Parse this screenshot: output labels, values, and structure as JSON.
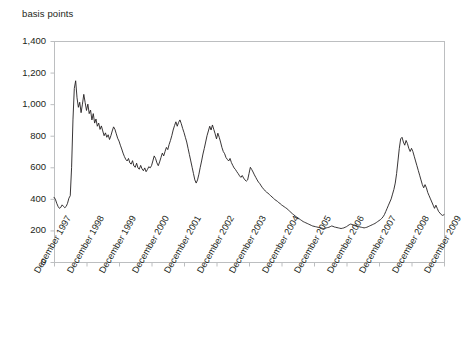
{
  "chart_data": {
    "type": "line",
    "title": "",
    "xlabel": "",
    "ylabel": "basis points",
    "ylim": [
      0,
      1400
    ],
    "yticks": [
      0,
      200,
      400,
      600,
      800,
      1000,
      1200,
      1400
    ],
    "ytick_labels": [
      "0",
      "200",
      "400",
      "600",
      "800",
      "1,000",
      "1,200",
      "1,400"
    ],
    "xtick_labels": [
      "December 1997",
      "December 1998",
      "December 1999",
      "December 2000",
      "December 2001",
      "December 2002",
      "December 2003",
      "December 2004",
      "December 2005",
      "December 2006",
      "December 2007",
      "December 2008",
      "December 2009"
    ],
    "grid": false,
    "legend": null,
    "line_color": "#231f20",
    "axis_color": "#bcbec0",
    "series": [
      {
        "name": "spread",
        "x_start": "December 1997",
        "x_end": "December 2009",
        "x_step_years": 0.0833,
        "values": [
          410,
          398,
          372,
          352,
          340,
          346,
          362,
          352,
          344,
          352,
          372,
          404,
          420,
          600,
          900,
          1100,
          1148,
          1040,
          980,
          1012,
          946,
          1000,
          1062,
          1010,
          960,
          1000,
          940,
          962,
          900,
          940,
          880,
          906,
          860,
          880,
          840,
          862,
          830,
          800,
          818,
          790,
          806,
          776,
          800,
          830,
          856,
          840,
          812,
          784,
          766,
          740,
          716,
          690,
          668,
          650,
          640,
          656,
          628,
          620,
          642,
          608,
          600,
          626,
          596,
          588,
          612,
          590,
          578,
          596,
          572,
          586,
          604,
          596,
          610,
          640,
          672,
          656,
          628,
          610,
          634,
          662,
          690,
          672,
          700,
          726,
          712,
          744,
          770,
          800,
          836,
          864,
          888,
          860,
          884,
          900,
          876,
          846,
          820,
          790,
          760,
          720,
          680,
          640,
          600,
          560,
          520,
          500,
          520,
          556,
          600,
          640,
          684,
          720,
          760,
          800,
          830,
          860,
          836,
          868,
          840,
          812,
          780,
          816,
          790,
          760,
          726,
          700,
          686,
          662,
          650,
          640,
          656,
          630,
          612,
          596,
          586,
          572,
          560,
          546,
          536,
          548,
          532,
          520,
          512,
          520,
          560,
          600,
          586,
          570,
          552,
          536,
          520,
          506,
          496,
          482,
          470,
          460,
          450,
          442,
          436,
          428,
          420,
          412,
          404,
          396,
          390,
          384,
          376,
          370,
          362,
          356,
          350,
          344,
          338,
          330,
          322,
          314,
          306,
          300,
          292,
          286,
          280,
          274,
          268,
          262,
          256,
          252,
          248,
          244,
          240,
          236,
          232,
          228,
          226,
          224,
          222,
          220,
          218,
          216,
          214,
          212,
          214,
          216,
          218,
          220,
          224,
          228,
          226,
          222,
          220,
          218,
          216,
          214,
          212,
          214,
          216,
          220,
          224,
          230,
          236,
          240,
          238,
          234,
          230,
          228,
          226,
          224,
          222,
          220,
          218,
          216,
          218,
          220,
          224,
          228,
          232,
          236,
          240,
          244,
          250,
          256,
          262,
          268,
          276,
          286,
          300,
          320,
          340,
          360,
          380,
          400,
          430,
          460,
          500,
          560,
          640,
          720,
          780,
          790,
          760,
          740,
          770,
          750,
          720,
          700,
          720,
          700,
          670,
          640,
          610,
          580,
          550,
          520,
          490,
          470,
          490,
          470,
          440,
          420,
          400,
          380,
          360,
          340,
          360,
          340,
          320,
          310,
          300,
          295,
          300
        ]
      }
    ]
  },
  "plot": {
    "left": 54,
    "right": 444,
    "top": 41,
    "bottom": 262
  }
}
